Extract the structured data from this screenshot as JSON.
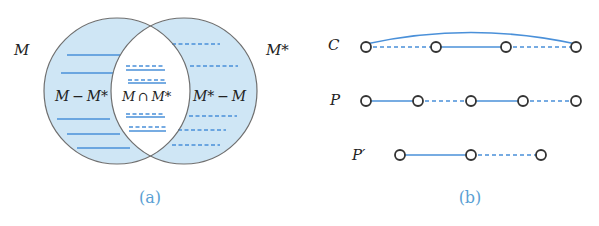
{
  "colors": {
    "circle_fill": "#cfe6f5",
    "circle_stroke": "#6f6f6f",
    "edge_blue": "#4a90d9",
    "node_stroke": "#333333",
    "caption": "#5a9fd4",
    "text": "#222222"
  },
  "panel_a": {
    "caption": "(a)",
    "set_label_left": "M",
    "set_label_right": "M*",
    "region_left_label": "M − M*",
    "region_middle_label": "M ∩ M*",
    "region_right_label": "M* − M",
    "left_circle": {
      "cx": 117,
      "cy": 91,
      "r": 73
    },
    "right_circle": {
      "cx": 184,
      "cy": 91,
      "r": 73
    },
    "left_region_lines": [
      {
        "y": 55,
        "x1": 67,
        "x2": 120,
        "style": "solid"
      },
      {
        "y": 73,
        "x1": 61,
        "x2": 113,
        "style": "solid"
      },
      {
        "y": 119,
        "x1": 57,
        "x2": 110,
        "style": "solid"
      },
      {
        "y": 134,
        "x1": 67,
        "x2": 120,
        "style": "solid"
      },
      {
        "y": 148,
        "x1": 77,
        "x2": 130,
        "style": "solid"
      }
    ],
    "middle_region_lines": [
      {
        "y_dashed": 66,
        "y_solid": 70,
        "x1": 126,
        "x2": 165
      },
      {
        "y_dashed": 80,
        "y_solid": 83,
        "x1": 128,
        "x2": 166
      },
      {
        "y_dashed": 114,
        "y_solid": 117,
        "x1": 126,
        "x2": 165
      },
      {
        "y_dashed": 127,
        "y_solid": 131,
        "x1": 129,
        "x2": 166
      }
    ],
    "right_region_lines": [
      {
        "y": 44,
        "x1": 172,
        "x2": 220,
        "style": "dashed"
      },
      {
        "y": 66,
        "x1": 190,
        "x2": 238,
        "style": "dashed"
      },
      {
        "y": 116,
        "x1": 189,
        "x2": 237,
        "style": "dashed"
      },
      {
        "y": 130,
        "x1": 178,
        "x2": 226,
        "style": "dashed"
      },
      {
        "y": 145,
        "x1": 172,
        "x2": 220,
        "style": "dashed"
      }
    ]
  },
  "panel_b": {
    "caption": "(b)",
    "rows": [
      {
        "label": "C",
        "y": 47,
        "nodes": [
          366,
          436,
          506,
          576
        ],
        "edges": [
          "dashed",
          "solid",
          "dashed"
        ],
        "closing_arc": {
          "from": 0,
          "to": 3,
          "style": "solid",
          "peak_y": 33
        }
      },
      {
        "label": "P",
        "y": 101,
        "nodes": [
          366,
          418,
          471,
          523,
          576
        ],
        "edges": [
          "solid",
          "dashed",
          "solid",
          "dashed"
        ]
      },
      {
        "label": "P′",
        "y": 155,
        "nodes": [
          400,
          471,
          541
        ],
        "edges": [
          "solid",
          "dashed"
        ]
      }
    ]
  }
}
